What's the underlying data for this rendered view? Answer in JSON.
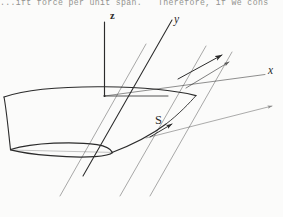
{
  "page": {
    "width": 283,
    "height": 217,
    "background_color": "#fbfbfa",
    "ink_color": "#2b2b2b",
    "text_color": "#7b7b78"
  },
  "body_text": {
    "clipped_line": "...ift force per unit span.   Therefore, if we cons"
  },
  "figure": {
    "caption": "",
    "type": "3d-wing-coordinate-diagram",
    "axes": [
      {
        "name": "z-axis",
        "label": "z",
        "direction": "vertical-up",
        "label_x": 110,
        "label_y": 10
      },
      {
        "name": "y-axis",
        "label": "y",
        "direction": "receding-upper-right",
        "label_x": 174,
        "label_y": 13
      },
      {
        "name": "x-axis",
        "label": "x",
        "direction": "horizontal-right",
        "label_x": 268,
        "label_y": 64
      }
    ],
    "annotations": [
      {
        "name": "area-label",
        "label": "S",
        "meaning": "planform reference area",
        "label_x": 155,
        "label_y": 113
      }
    ],
    "elements": [
      "wing-planform-surface",
      "airfoil-cross-section",
      "leading-edge-line",
      "trailing-edge-line",
      "chordwise-reference-line",
      "span-direction-arrow",
      "area-indicator-arrow",
      "origin-point"
    ]
  }
}
